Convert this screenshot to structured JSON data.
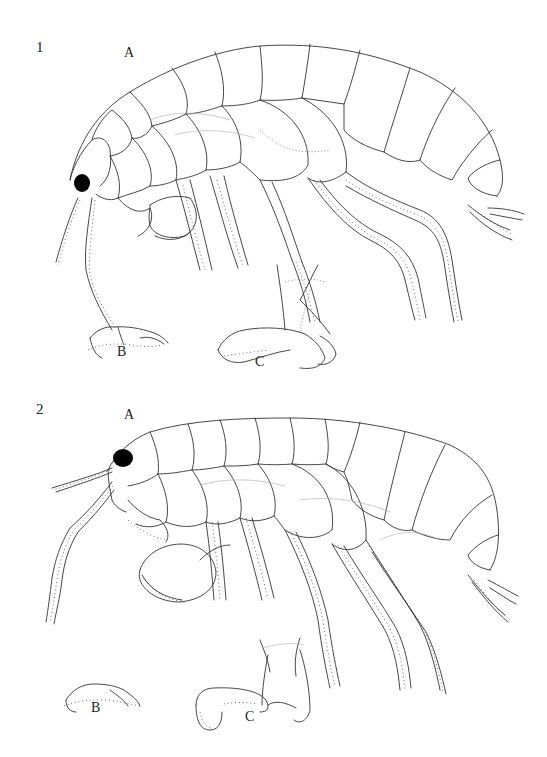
{
  "plate": {
    "figures": [
      {
        "number": "1",
        "views": [
          {
            "letter": "A",
            "subject": "whole-body-lateral"
          },
          {
            "letter": "B",
            "subject": "gnathopod-1"
          },
          {
            "letter": "C",
            "subject": "gnathopod-2"
          }
        ]
      },
      {
        "number": "2",
        "views": [
          {
            "letter": "A",
            "subject": "whole-body-lateral"
          },
          {
            "letter": "B",
            "subject": "gnathopod-1"
          },
          {
            "letter": "C",
            "subject": "gnathopod-2"
          }
        ]
      }
    ],
    "colors": {
      "line": "#333333",
      "eye": "#000000",
      "background": "#ffffff"
    }
  }
}
